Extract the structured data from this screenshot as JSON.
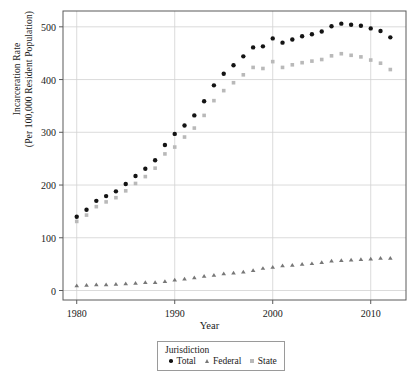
{
  "chart_data": {
    "type": "scatter",
    "title": "",
    "xlabel": "Year",
    "ylabel": "Incarceration Rate (Per 100,000 Resident Population)",
    "ylabel_line1": "Incarceration Rate",
    "ylabel_line2": "(Per 100,000 Resident Population)",
    "xlim": [
      1978.6,
      2013.6
    ],
    "ylim": [
      -18,
      530
    ],
    "grid": true,
    "legend_position": "below-axes",
    "legend_title": "Jurisdiction",
    "xticks": [
      1980,
      1990,
      2000,
      2010
    ],
    "xtick_labels": [
      "1980",
      "1990",
      "2000",
      "2010"
    ],
    "yticks": [
      0,
      100,
      200,
      300,
      400,
      500
    ],
    "ytick_labels": [
      "0",
      "100",
      "200",
      "300",
      "400",
      "500"
    ],
    "x": [
      1980,
      1981,
      1982,
      1983,
      1984,
      1985,
      1986,
      1987,
      1988,
      1989,
      1990,
      1991,
      1992,
      1993,
      1994,
      1995,
      1996,
      1997,
      1998,
      1999,
      2000,
      2001,
      2002,
      2003,
      2004,
      2005,
      2006,
      2007,
      2008,
      2009,
      2010,
      2011,
      2012
    ],
    "series": [
      {
        "name": "Total",
        "marker": "circle",
        "color": "#141414",
        "values": [
          140,
          153,
          170,
          179,
          188,
          202,
          217,
          231,
          247,
          276,
          297,
          313,
          332,
          359,
          389,
          411,
          427,
          444,
          461,
          463,
          478,
          470,
          476,
          482,
          486,
          491,
          501,
          506,
          504,
          502,
          497,
          492,
          480
        ]
      },
      {
        "name": "Federal",
        "marker": "triangle",
        "color": "#777777",
        "values": [
          9,
          10,
          11,
          11,
          12,
          13,
          14,
          15,
          15,
          17,
          20,
          22,
          24,
          27,
          29,
          32,
          33,
          35,
          38,
          42,
          44,
          47,
          48,
          50,
          51,
          53,
          56,
          57,
          58,
          59,
          60,
          61,
          61
        ]
      },
      {
        "name": "State",
        "marker": "square",
        "color": "#b9b9b9",
        "values": [
          131,
          143,
          159,
          168,
          176,
          189,
          203,
          216,
          232,
          259,
          272,
          291,
          308,
          332,
          360,
          379,
          394,
          409,
          423,
          421,
          434,
          423,
          428,
          432,
          435,
          438,
          445,
          449,
          446,
          443,
          437,
          431,
          419
        ]
      }
    ]
  },
  "axis": {
    "y_title_line1": "Incarceration Rate",
    "y_title_line2": "(Per 100,000 Resident Population)",
    "x_title": "Year"
  },
  "legend": {
    "title": "Jurisdiction",
    "items": [
      {
        "label": "Total",
        "marker": "circle-icon",
        "color": "#141414"
      },
      {
        "label": "Federal",
        "marker": "triangle-icon",
        "color": "#777777"
      },
      {
        "label": "State",
        "marker": "square-icon",
        "color": "#b9b9b9"
      }
    ]
  }
}
